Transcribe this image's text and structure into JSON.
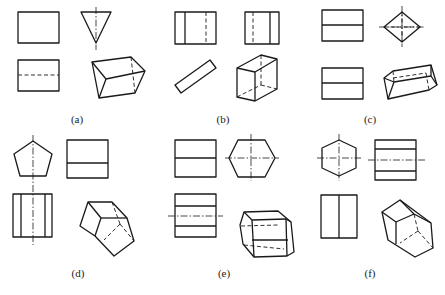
{
  "figure": {
    "panels": [
      {
        "id": "a",
        "label": "(a)",
        "solid": "triangular prism (apex down)"
      },
      {
        "id": "b",
        "label": "(b)",
        "solid": "rectangular prism (inclined)"
      },
      {
        "id": "c",
        "label": "(c)",
        "solid": "square prism (diamond end view)"
      },
      {
        "id": "d",
        "label": "(d)",
        "solid": "pentagonal prism"
      },
      {
        "id": "e",
        "label": "(e)",
        "solid": "hexagonal prism (horizontal axis)"
      },
      {
        "id": "f",
        "label": "(f)",
        "solid": "hexagonal prism"
      }
    ]
  },
  "colors": {
    "line": "#1a1a1a",
    "background": "#ffffff"
  }
}
